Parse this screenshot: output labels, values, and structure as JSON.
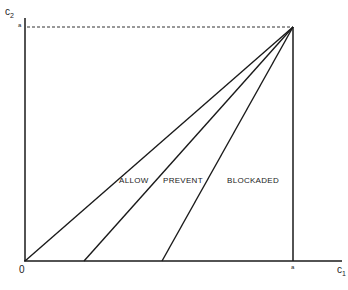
{
  "diagram": {
    "y_axis_label": "c",
    "y_axis_sub": "2",
    "x_axis_label": "c",
    "x_axis_sub": "1",
    "origin_label": "0",
    "x_tick_label": "a",
    "y_tick_label": "a",
    "regions": [
      {
        "label": "ALLOW"
      },
      {
        "label": "PREVENT"
      },
      {
        "label": "BLOCKADED"
      }
    ],
    "line_color": "#1a1a1a"
  }
}
